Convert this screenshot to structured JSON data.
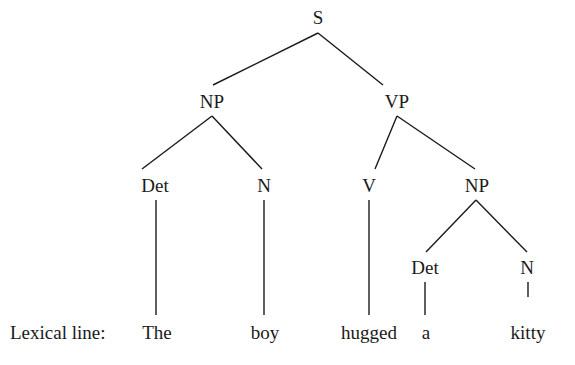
{
  "tree": {
    "nodes": [
      {
        "id": "S",
        "label": "S"
      },
      {
        "id": "NP1",
        "label": "NP"
      },
      {
        "id": "VP",
        "label": "VP"
      },
      {
        "id": "Det1",
        "label": "Det"
      },
      {
        "id": "N1",
        "label": "N"
      },
      {
        "id": "V",
        "label": "V"
      },
      {
        "id": "NP2",
        "label": "NP"
      },
      {
        "id": "Det2",
        "label": "Det"
      },
      {
        "id": "N2",
        "label": "N"
      }
    ],
    "edges": [
      [
        "S",
        "NP1"
      ],
      [
        "S",
        "VP"
      ],
      [
        "NP1",
        "Det1"
      ],
      [
        "NP1",
        "N1"
      ],
      [
        "VP",
        "V"
      ],
      [
        "VP",
        "NP2"
      ],
      [
        "NP2",
        "Det2"
      ],
      [
        "NP2",
        "N2"
      ],
      [
        "Det1",
        "w0"
      ],
      [
        "N1",
        "w1"
      ],
      [
        "V",
        "w2"
      ],
      [
        "Det2",
        "w3"
      ],
      [
        "N2",
        "w4"
      ]
    ],
    "lexical_line_label": "Lexical line:",
    "words": [
      "The",
      "boy",
      "hugged",
      "a",
      "kitty"
    ]
  }
}
